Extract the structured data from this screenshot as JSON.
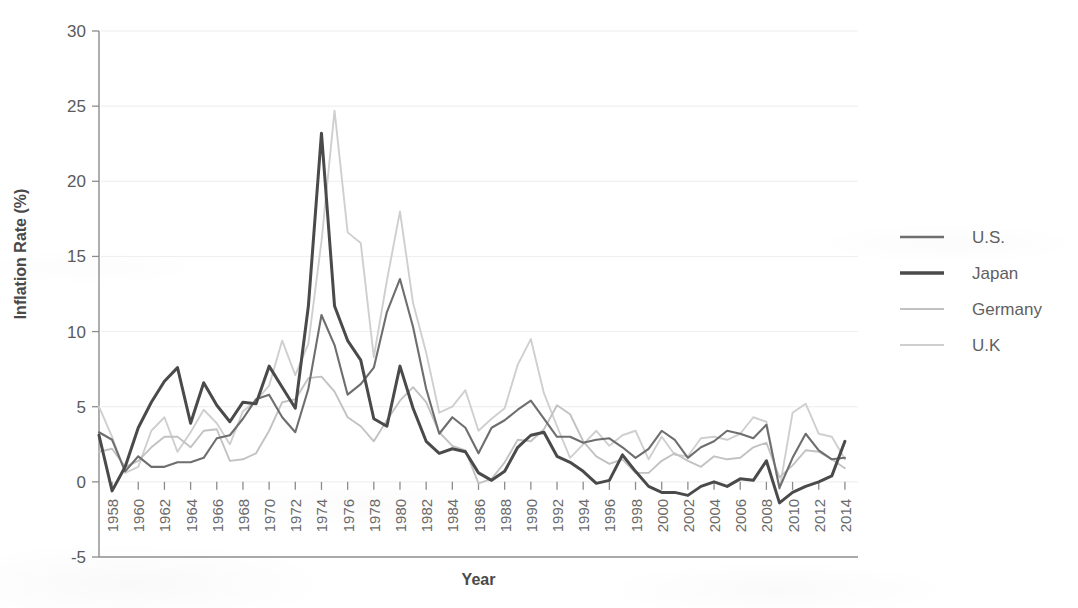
{
  "chart_data": {
    "type": "line",
    "title": "",
    "xlabel": "Year",
    "ylabel": "Inflation Rate (%)",
    "xlim": [
      1957,
      2015
    ],
    "ylim": [
      -5,
      30
    ],
    "yticks": [
      -5,
      0,
      5,
      10,
      15,
      20,
      25,
      30
    ],
    "ytick_labels": [
      "-5",
      "0",
      "5",
      "10",
      "15",
      "20",
      "25",
      "30"
    ],
    "xticks": [
      1958,
      1960,
      1962,
      1964,
      1966,
      1968,
      1970,
      1972,
      1974,
      1976,
      1978,
      1980,
      1982,
      1984,
      1986,
      1988,
      1990,
      1992,
      1994,
      1996,
      1998,
      2000,
      2002,
      2004,
      2006,
      2008,
      2010,
      2012,
      2014
    ],
    "xtick_labels": [
      "1958",
      "1960",
      "1962",
      "1964",
      "1966",
      "1968",
      "1970",
      "1972",
      "1974",
      "1976",
      "1978",
      "1980",
      "1982",
      "1984",
      "1986",
      "1988",
      "1990",
      "1992",
      "1994",
      "1996",
      "1998",
      "2000",
      "2002",
      "2004",
      "2006",
      "2008",
      "2010",
      "2012",
      "2014"
    ],
    "xtick_rotation": 90,
    "grid": true,
    "grid_axis": "y",
    "legend_position": "right",
    "x": [
      1957,
      1958,
      1959,
      1960,
      1961,
      1962,
      1963,
      1964,
      1965,
      1966,
      1967,
      1968,
      1969,
      1970,
      1971,
      1972,
      1973,
      1974,
      1975,
      1976,
      1977,
      1978,
      1979,
      1980,
      1981,
      1982,
      1983,
      1984,
      1985,
      1986,
      1987,
      1988,
      1989,
      1990,
      1991,
      1992,
      1993,
      1994,
      1995,
      1996,
      1997,
      1998,
      1999,
      2000,
      2001,
      2002,
      2003,
      2004,
      2005,
      2006,
      2007,
      2008,
      2009,
      2010,
      2011,
      2012,
      2013,
      2014
    ],
    "series": [
      {
        "name": "U.S.",
        "color": "#6e6e6e",
        "width": 2.1,
        "values": [
          3.3,
          2.8,
          0.7,
          1.7,
          1.0,
          1.0,
          1.3,
          1.3,
          1.6,
          2.9,
          3.1,
          4.2,
          5.5,
          5.8,
          4.3,
          3.3,
          6.2,
          11.1,
          9.1,
          5.8,
          6.5,
          7.6,
          11.3,
          13.5,
          10.3,
          6.2,
          3.2,
          4.3,
          3.6,
          1.9,
          3.6,
          4.1,
          4.8,
          5.4,
          4.2,
          3.0,
          3.0,
          2.6,
          2.8,
          2.9,
          2.3,
          1.6,
          2.2,
          3.4,
          2.8,
          1.6,
          2.3,
          2.7,
          3.4,
          3.2,
          2.9,
          3.8,
          -0.4,
          1.6,
          3.2,
          2.1,
          1.5,
          1.6
        ]
      },
      {
        "name": "Japan",
        "color": "#4a4a4a",
        "width": 3.0,
        "values": [
          3.1,
          -0.6,
          1.0,
          3.6,
          5.3,
          6.7,
          7.6,
          3.9,
          6.6,
          5.1,
          4.0,
          5.3,
          5.2,
          7.7,
          6.3,
          4.9,
          11.7,
          23.2,
          11.7,
          9.4,
          8.1,
          4.2,
          3.7,
          7.7,
          4.9,
          2.7,
          1.9,
          2.2,
          2.0,
          0.6,
          0.1,
          0.7,
          2.3,
          3.1,
          3.3,
          1.7,
          1.3,
          0.7,
          -0.1,
          0.1,
          1.8,
          0.7,
          -0.3,
          -0.7,
          -0.7,
          -0.9,
          -0.3,
          0.0,
          -0.3,
          0.2,
          0.1,
          1.4,
          -1.4,
          -0.7,
          -0.3,
          0.0,
          0.4,
          2.7
        ]
      },
      {
        "name": "Germany",
        "color": "#c2c2c2",
        "width": 1.9,
        "values": [
          2.0,
          2.2,
          1.0,
          1.4,
          2.3,
          3.0,
          3.0,
          2.3,
          3.4,
          3.5,
          1.4,
          1.5,
          1.9,
          3.4,
          5.3,
          5.5,
          6.9,
          7.0,
          6.0,
          4.3,
          3.7,
          2.7,
          4.1,
          5.4,
          6.3,
          5.3,
          3.3,
          2.4,
          2.1,
          -0.1,
          0.2,
          1.3,
          2.8,
          2.7,
          3.5,
          5.1,
          4.5,
          2.7,
          1.7,
          1.2,
          1.5,
          0.6,
          0.6,
          1.4,
          1.9,
          1.4,
          1.0,
          1.7,
          1.5,
          1.6,
          2.3,
          2.6,
          0.3,
          1.1,
          2.1,
          2.0,
          1.5,
          0.9
        ]
      },
      {
        "name": "U.K",
        "color": "#cfcfcf",
        "width": 1.9,
        "values": [
          5.0,
          3.0,
          0.6,
          1.0,
          3.4,
          4.3,
          2.0,
          3.3,
          4.8,
          3.9,
          2.5,
          4.7,
          5.4,
          6.4,
          9.4,
          7.1,
          9.2,
          16.0,
          24.7,
          16.6,
          15.9,
          8.3,
          13.4,
          18.0,
          11.9,
          8.6,
          4.6,
          5.0,
          6.1,
          3.4,
          4.2,
          4.9,
          7.8,
          9.5,
          5.9,
          3.7,
          1.6,
          2.5,
          3.4,
          2.4,
          3.1,
          3.4,
          1.5,
          3.0,
          1.8,
          1.7,
          2.9,
          3.0,
          2.8,
          3.2,
          4.3,
          4.0,
          -0.5,
          4.6,
          5.2,
          3.2,
          3.0,
          1.5
        ]
      }
    ]
  },
  "legend": {
    "items": [
      {
        "label": "U.S.",
        "color": "#6e6e6e",
        "width": 2.6
      },
      {
        "label": "Japan",
        "color": "#4a4a4a",
        "width": 3.4
      },
      {
        "label": "Germany",
        "color": "#c2c2c2",
        "width": 2.0
      },
      {
        "label": "U.K",
        "color": "#cfcfcf",
        "width": 2.0
      }
    ]
  }
}
